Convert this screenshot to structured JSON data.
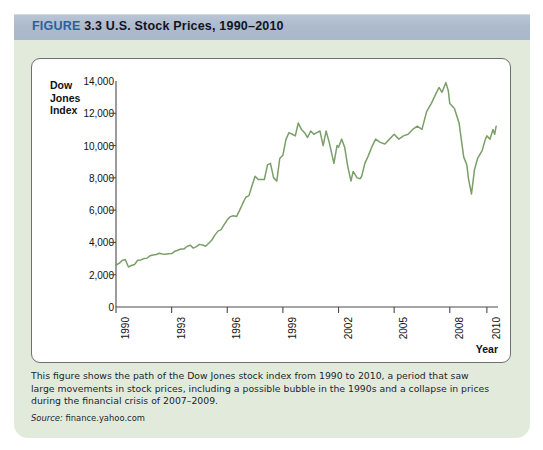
{
  "header": {
    "figure_word": "FIGURE",
    "figure_number": "3.3",
    "title": "U.S. Stock Prices, 1990–2010",
    "accent_color": "#2b5f9e",
    "bar_color": "#aebbcd"
  },
  "panel": {
    "background_color": "#e2ebdb",
    "card_background": "#ffffff",
    "card_border_color": "#6f6f6f"
  },
  "caption": {
    "body": "This figure shows the path of the Dow Jones stock index from 1990 to 2010, a period that saw large movements in stock prices, including a possible bubble in the 1990s and a collapse in prices during the financial crisis of 2007–2009.",
    "source_label": "Source:",
    "source_value": "finance.yahoo.com"
  },
  "chart_data": {
    "type": "line",
    "title": "U.S. Stock Prices, 1990–2010",
    "ylabel": "Dow Jones Index",
    "xlabel": "Year",
    "grid": false,
    "legend": null,
    "line_color": "#7a9f68",
    "axis_color": "#4a4a4a",
    "xlim": [
      1990,
      2010.6
    ],
    "ylim": [
      0,
      14000
    ],
    "yticks": [
      0,
      2000,
      4000,
      6000,
      8000,
      10000,
      12000,
      14000
    ],
    "ytick_labels": [
      "0",
      "2,000",
      "4,000",
      "6,000",
      "8,000",
      "10,000",
      "12,000",
      "14,000"
    ],
    "xticks": [
      1990,
      1993,
      1996,
      1999,
      2002,
      2005,
      2008,
      2010
    ],
    "xtick_labels": [
      "1990",
      "1993",
      "1996",
      "1999",
      "2002",
      "2005",
      "2008",
      "2010"
    ],
    "series": [
      {
        "name": "Dow Jones Index",
        "x": [
          1990.0,
          1990.17,
          1990.33,
          1990.5,
          1990.67,
          1990.83,
          1991.0,
          1991.17,
          1991.33,
          1991.5,
          1991.67,
          1991.83,
          1992.0,
          1992.17,
          1992.33,
          1992.5,
          1992.67,
          1992.83,
          1993.0,
          1993.17,
          1993.33,
          1993.5,
          1993.67,
          1993.83,
          1994.0,
          1994.17,
          1994.33,
          1994.5,
          1994.67,
          1994.83,
          1995.0,
          1995.17,
          1995.33,
          1995.5,
          1995.67,
          1995.83,
          1996.0,
          1996.17,
          1996.33,
          1996.5,
          1996.67,
          1996.83,
          1997.0,
          1997.17,
          1997.33,
          1997.5,
          1997.67,
          1997.83,
          1998.0,
          1998.17,
          1998.33,
          1998.5,
          1998.67,
          1998.83,
          1999.0,
          1999.17,
          1999.33,
          1999.5,
          1999.67,
          1999.83,
          2000.0,
          2000.17,
          2000.33,
          2000.5,
          2000.67,
          2000.83,
          2001.0,
          2001.17,
          2001.33,
          2001.5,
          2001.75,
          2001.92,
          2002.0,
          2002.17,
          2002.33,
          2002.5,
          2002.67,
          2002.79,
          2003.0,
          2003.17,
          2003.25,
          2003.42,
          2003.58,
          2003.83,
          2004.0,
          2004.25,
          2004.5,
          2004.75,
          2005.0,
          2005.25,
          2005.5,
          2005.75,
          2006.0,
          2006.25,
          2006.5,
          2006.75,
          2007.0,
          2007.25,
          2007.42,
          2007.58,
          2007.79,
          2007.92,
          2008.0,
          2008.25,
          2008.5,
          2008.75,
          2008.92,
          2009.0,
          2009.17,
          2009.33,
          2009.5,
          2009.75,
          2009.92,
          2010.0,
          2010.17,
          2010.33,
          2010.42,
          2010.5
        ],
        "y": [
          2600,
          2700,
          2880,
          2940,
          2480,
          2570,
          2630,
          2900,
          2910,
          3000,
          3020,
          3170,
          3220,
          3250,
          3330,
          3280,
          3270,
          3300,
          3310,
          3450,
          3520,
          3590,
          3600,
          3750,
          3830,
          3650,
          3740,
          3880,
          3840,
          3760,
          3950,
          4150,
          4450,
          4700,
          4790,
          5100,
          5400,
          5600,
          5650,
          5600,
          6000,
          6400,
          6800,
          6900,
          7500,
          8100,
          7900,
          7900,
          7900,
          8800,
          8900,
          8000,
          7800,
          9200,
          9400,
          10400,
          10800,
          10700,
          10600,
          11400,
          11000,
          10800,
          10500,
          10900,
          10700,
          10800,
          10900,
          10000,
          10900,
          10200,
          8900,
          10000,
          9900,
          10400,
          9900,
          8700,
          7800,
          8400,
          8000,
          7950,
          8100,
          8900,
          9300,
          10000,
          10400,
          10200,
          10100,
          10400,
          10700,
          10400,
          10600,
          10700,
          11000,
          11200,
          11000,
          12100,
          12600,
          13200,
          13600,
          13300,
          13900,
          13400,
          12600,
          12300,
          11400,
          9300,
          8800,
          8000,
          7000,
          8500,
          9200,
          9700,
          10400,
          10600,
          10400,
          11000,
          10700,
          11200
        ]
      }
    ]
  }
}
